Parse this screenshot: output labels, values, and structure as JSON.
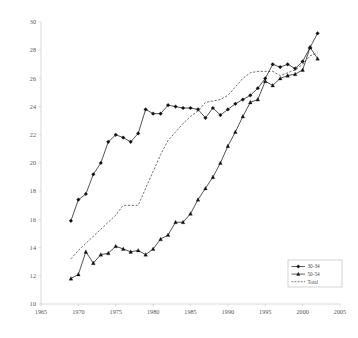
{
  "chart_data": {
    "type": "line",
    "title": "",
    "subtitle": "",
    "xlabel": "",
    "ylabel": "",
    "xlim": [
      1965,
      2005
    ],
    "ylim": [
      10,
      30
    ],
    "xticks": [
      1965,
      1970,
      1975,
      1980,
      1985,
      1990,
      1995,
      2000,
      2005
    ],
    "yticks": [
      10,
      12,
      14,
      16,
      18,
      20,
      22,
      24,
      26,
      28,
      30
    ],
    "xtick_labels": [
      "1965",
      "1970",
      "1975",
      "1980",
      "1985",
      "1990",
      "1995",
      "2000",
      "2005"
    ],
    "ytick_labels": [
      "10",
      "12",
      "14",
      "16",
      "18",
      "20",
      "22",
      "24",
      "26",
      "28",
      "30"
    ],
    "grid": false,
    "legend_position": "bottom-right",
    "series": [
      {
        "name": "30-34",
        "marker": "diamond",
        "linestyle": "solid",
        "color": "#111111",
        "x": [
          1969,
          1970,
          1971,
          1972,
          1973,
          1974,
          1975,
          1976,
          1977,
          1978,
          1979,
          1980,
          1981,
          1982,
          1983,
          1984,
          1985,
          1986,
          1987,
          1988,
          1989,
          1990,
          1991,
          1992,
          1993,
          1994,
          1995,
          1996,
          1997,
          1998,
          1999,
          2000,
          2001,
          2002
        ],
        "values": [
          15.9,
          17.4,
          17.8,
          19.2,
          20.0,
          21.5,
          22.0,
          21.8,
          21.5,
          22.1,
          23.8,
          23.5,
          23.5,
          24.1,
          24.0,
          23.9,
          23.9,
          23.8,
          23.2,
          23.9,
          23.4,
          23.8,
          24.2,
          24.5,
          24.8,
          25.3,
          26.0,
          27.0,
          26.8,
          27.0,
          26.7,
          27.2,
          28.2,
          29.2
        ]
      },
      {
        "name": "50-54",
        "marker": "triangle",
        "linestyle": "solid",
        "color": "#111111",
        "x": [
          1969,
          1970,
          1971,
          1972,
          1973,
          1974,
          1975,
          1976,
          1977,
          1978,
          1979,
          1980,
          1981,
          1982,
          1983,
          1984,
          1985,
          1986,
          1987,
          1988,
          1989,
          1990,
          1991,
          1992,
          1993,
          1994,
          1995,
          1996,
          1997,
          1998,
          1999,
          2000,
          2001,
          2002
        ],
        "values": [
          11.8,
          12.1,
          13.7,
          12.9,
          13.5,
          13.6,
          14.1,
          13.9,
          13.7,
          13.8,
          13.5,
          13.9,
          14.6,
          14.9,
          15.8,
          15.8,
          16.4,
          17.4,
          18.2,
          19.0,
          20.0,
          21.2,
          22.2,
          23.3,
          24.3,
          24.5,
          25.8,
          25.5,
          26.0,
          26.2,
          26.3,
          26.6,
          28.2,
          27.4
        ]
      },
      {
        "name": "Total",
        "marker": "none",
        "linestyle": "dashed",
        "color": "#3c3c3c",
        "x": [
          1969,
          1970,
          1971,
          1972,
          1973,
          1974,
          1975,
          1976,
          1977,
          1978,
          1979,
          1980,
          1981,
          1982,
          1983,
          1984,
          1985,
          1986,
          1987,
          1988,
          1989,
          1990,
          1991,
          1992,
          1993,
          1994,
          1995,
          1996,
          1997,
          1998,
          1999,
          2000,
          2001,
          2002
        ],
        "values": [
          13.2,
          13.8,
          14.3,
          14.8,
          15.3,
          15.8,
          16.3,
          17.0,
          17.0,
          17.0,
          18.2,
          19.4,
          20.6,
          21.6,
          22.2,
          22.8,
          23.3,
          23.7,
          24.3,
          24.4,
          24.5,
          24.8,
          25.4,
          26.0,
          26.4,
          26.5,
          26.5,
          26.5,
          26.2,
          26.4,
          26.6,
          27.0,
          27.6,
          27.8
        ]
      }
    ],
    "legend_entries": [
      {
        "label": "30-34",
        "marker": "diamond",
        "linestyle": "solid"
      },
      {
        "label": "50-54",
        "marker": "triangle",
        "linestyle": "solid"
      },
      {
        "label": "Total",
        "marker": "none",
        "linestyle": "dashed"
      }
    ]
  },
  "axes": {
    "plot_left": 41,
    "plot_right": 340,
    "plot_top": 22,
    "plot_bottom": 304
  },
  "legend": {
    "x": 288,
    "y": 260,
    "width": 54,
    "height": 27
  }
}
